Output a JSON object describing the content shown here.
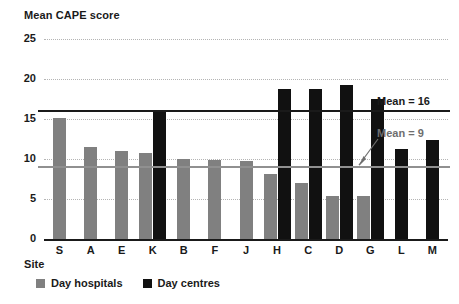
{
  "chart_data": {
    "type": "bar",
    "title": "Mean CAPE score",
    "xlabel": "Site",
    "ylabel": "Mean CAPE score",
    "categories": [
      "S",
      "A",
      "E",
      "K",
      "B",
      "F",
      "J",
      "H",
      "C",
      "D",
      "G",
      "L",
      "M"
    ],
    "series": [
      {
        "name": "Day hospitals",
        "color": "#808080",
        "values": [
          15.1,
          11.5,
          11.0,
          10.7,
          10.0,
          9.9,
          9.8,
          8.1,
          7.0,
          5.4,
          5.4,
          null,
          null
        ]
      },
      {
        "name": "Day centres",
        "color": "#111111",
        "values": [
          null,
          null,
          null,
          16.0,
          null,
          null,
          null,
          18.7,
          18.7,
          19.3,
          17.5,
          11.2,
          12.4
        ]
      }
    ],
    "ylim": [
      0,
      25
    ],
    "yticks": [
      0,
      5,
      10,
      15,
      20,
      25
    ],
    "grid": true,
    "legend_position": "bottom-left",
    "annotations": [
      {
        "name": "mean-16",
        "label": "Mean = 16",
        "value": 16,
        "color": "#1a1a1a",
        "style": "solid-line"
      },
      {
        "name": "mean-9",
        "label": "Mean = 9",
        "value": 9,
        "color": "#909090",
        "style": "solid-line-with-arrow"
      }
    ]
  },
  "labels": {
    "y_axis_title": "Mean CAPE score",
    "x_axis_title": "Site",
    "yticks": [
      "25",
      "20",
      "15",
      "10",
      "5",
      "0"
    ],
    "xticks": [
      "S",
      "A",
      "E",
      "K",
      "B",
      "F",
      "J",
      "H",
      "C",
      "D",
      "G",
      "L",
      "M"
    ],
    "mean_16": "Mean = 16",
    "mean_9": "Mean = 9",
    "legend": {
      "hospitals": "Day hospitals",
      "centres": "Day centres"
    }
  }
}
